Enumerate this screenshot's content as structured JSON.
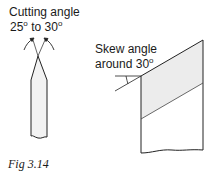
{
  "figure": {
    "caption": "Fig 3.14",
    "cutting_angle": {
      "title": "Cutting angle",
      "range_from": "25",
      "range_to": "30",
      "range_connector": "to",
      "degree_mark": "o"
    },
    "skew_angle": {
      "title": "Skew angle",
      "prefix": "around",
      "value": "30",
      "degree_mark": "o"
    }
  },
  "colors": {
    "line": "#222222",
    "fill": "#f2f2f2",
    "text": "#1a1a1a"
  }
}
